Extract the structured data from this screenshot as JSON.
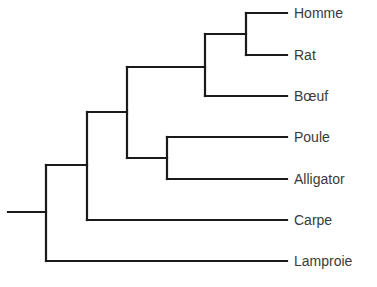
{
  "diagram": {
    "type": "phylogenetic-tree",
    "layout": "rectangular-cladogram",
    "line_color": "#1a1a1a",
    "label_color": "#3a3a3a",
    "background": "#ffffff",
    "taxa": [
      {
        "label": "Homme",
        "y": 13
      },
      {
        "label": "Rat",
        "y": 55
      },
      {
        "label": "Bœuf",
        "y": 96
      },
      {
        "label": "Poule",
        "y": 137
      },
      {
        "label": "Alligator",
        "y": 179
      },
      {
        "label": "Carpe",
        "y": 220
      },
      {
        "label": "Lamproie",
        "y": 261
      }
    ],
    "topology": "(Lamproie,(Carpe,((Poule,Alligator),(Bœuf,(Homme,Rat)))));",
    "leaf_line_end_x": 287,
    "label_x": 294,
    "nodes": [
      {
        "id": "root",
        "x": 46,
        "y_top": 165,
        "y_bottom": 261,
        "y_mid": 212,
        "children": [
          "gnathostomes",
          "Lamproie"
        ]
      },
      {
        "id": "gnathostomes",
        "x": 87,
        "y_top": 112,
        "y_bottom": 220,
        "y_mid": 165,
        "children": [
          "tetrapods",
          "Carpe"
        ]
      },
      {
        "id": "tetrapods",
        "x": 127,
        "y_top": 67,
        "y_bottom": 158,
        "y_mid": 112,
        "children": [
          "mammals",
          "sauropsids"
        ]
      },
      {
        "id": "mammals",
        "x": 205,
        "y_top": 34,
        "y_bottom": 96,
        "y_mid": 67,
        "children": [
          "homme-rat",
          "Bœuf"
        ]
      },
      {
        "id": "homme-rat",
        "x": 246,
        "y_top": 13,
        "y_bottom": 55,
        "y_mid": 34,
        "children": [
          "Homme",
          "Rat"
        ]
      },
      {
        "id": "sauropsids",
        "x": 167,
        "y_top": 137,
        "y_bottom": 179,
        "y_mid": 158,
        "children": [
          "Poule",
          "Alligator"
        ]
      }
    ],
    "root_stem": {
      "x_start": 8,
      "x_end": 46,
      "y": 212
    }
  }
}
